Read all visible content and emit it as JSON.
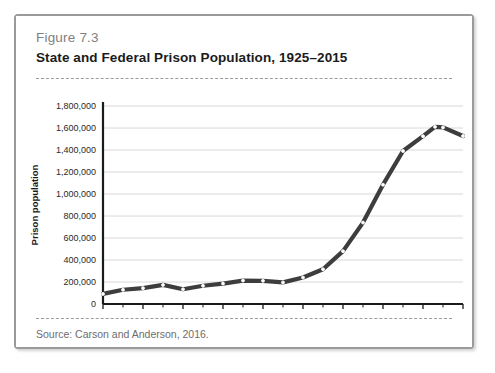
{
  "figure": {
    "number_label": "Figure 7.3",
    "title": "State and Federal Prison Population, 1925–2015",
    "source_note": "Source: Carson and Anderson, 2016."
  },
  "style": {
    "frame_border": "#9a9a9a",
    "background": "#ffffff",
    "line_color": "#3d3d3d",
    "gridline_color": "#d8d8d8",
    "axis_color": "#1b1b1b",
    "marker_fill": "#ffffff",
    "title_color": "#1b1b1b",
    "fignum_color": "#808080",
    "source_color": "#6d6d6d"
  },
  "chart_data": {
    "type": "line",
    "title": "State and Federal Prison Population, 1925–2015",
    "xlabel": "",
    "ylabel": "Prison population",
    "xlim": [
      1925,
      2015
    ],
    "ylim": [
      0,
      1800000
    ],
    "grid": true,
    "legend": false,
    "legend_position": "none",
    "markers": true,
    "marker_style": "circle-open",
    "ytick_labels": [
      "0",
      "200,000",
      "400,000",
      "600,000",
      "800,000",
      "1,000,000",
      "1,200,000",
      "1,400,000",
      "1,600,000",
      "1,800,000"
    ],
    "yticks": [
      0,
      200000,
      400000,
      600000,
      800000,
      1000000,
      1200000,
      1400000,
      1600000,
      1800000
    ],
    "xtick_labels": [
      "1925",
      "1935",
      "1945",
      "1955",
      "1965",
      "1975",
      "1985",
      "1995",
      "2005",
      "2015"
    ],
    "xticks": [
      1925,
      1935,
      1945,
      1955,
      1965,
      1975,
      1985,
      1995,
      2005,
      2015
    ],
    "xminor_ticks": [
      1930,
      1940,
      1950,
      1960,
      1970,
      1980,
      1990,
      2000,
      2010
    ],
    "x": [
      1925,
      1930,
      1935,
      1940,
      1945,
      1950,
      1955,
      1960,
      1965,
      1970,
      1975,
      1980,
      1985,
      1990,
      1995,
      2000,
      2005,
      2008,
      2010,
      2015
    ],
    "values": [
      91669,
      129453,
      144180,
      173706,
      133649,
      166123,
      185780,
      212953,
      210895,
      196429,
      240593,
      315974,
      480568,
      739980,
      1085022,
      1391261,
      1525910,
      1610446,
      1605127,
      1526792
    ],
    "series": [
      {
        "name": "Prison population",
        "values": [
          91669,
          129453,
          144180,
          173706,
          133649,
          166123,
          185780,
          212953,
          210895,
          196429,
          240593,
          315974,
          480568,
          739980,
          1085022,
          1391261,
          1525910,
          1610446,
          1605127,
          1526792
        ]
      }
    ]
  }
}
